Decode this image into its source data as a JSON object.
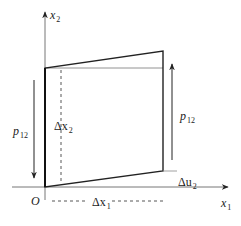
{
  "diagram": {
    "type": "shear-deformation-element",
    "colors": {
      "stroke": "#222222",
      "thin_stroke": "#666666",
      "background": "#ffffff"
    },
    "axes": {
      "x_label": "x",
      "x_sub": "1",
      "y_label": "x",
      "y_sub": "2",
      "origin_label": "O"
    },
    "labels": {
      "p_left": "p",
      "p_left_sub": "12",
      "p_right": "p",
      "p_right_sub": "12",
      "dx2": "Δx",
      "dx2_sub": "2",
      "dx1": "Δx",
      "dx1_sub": "1",
      "du2": "Δu",
      "du2_sub": "2"
    }
  }
}
